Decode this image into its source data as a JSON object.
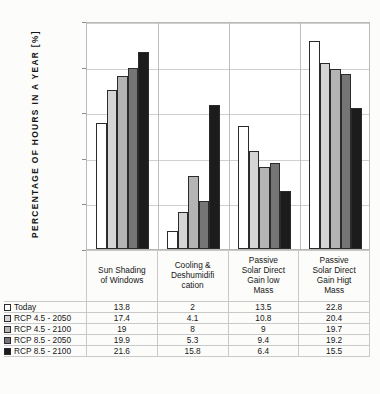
{
  "chart_data": {
    "type": "bar",
    "title": "",
    "xlabel": "",
    "ylabel": "PERCENTAGE OF HOURS IN A YEAR  [%]",
    "ylim": [
      0,
      25
    ],
    "yticks": [
      0,
      5,
      10,
      15,
      20,
      25
    ],
    "grid": true,
    "legend_position": "table-left-column",
    "categories": [
      "Sun Shading of Windows",
      "Cooling & Deshumidifi cation",
      "Passive Solar Direct Gain low Mass",
      "Passive Solar Direct Gain Higt Mass"
    ],
    "series": [
      {
        "name": "Today",
        "color": "#ffffff",
        "values": [
          13.8,
          2,
          13.5,
          22.8
        ]
      },
      {
        "name": "RCP 4.5 - 2050",
        "color": "#d5d5d5",
        "values": [
          17.4,
          4.1,
          10.8,
          20.4
        ]
      },
      {
        "name": "RCP 4.5 - 2100",
        "color": "#b4b4b4",
        "values": [
          19,
          8,
          9,
          19.7
        ]
      },
      {
        "name": "RCP 8.5 - 2050",
        "color": "#757575",
        "values": [
          19.9,
          5.3,
          9.4,
          19.2
        ]
      },
      {
        "name": "RCP 8.5 - 2100",
        "color": "#1c1c1c",
        "values": [
          21.6,
          15.8,
          6.4,
          15.5
        ]
      }
    ]
  },
  "axis": {
    "y_title": "PERCENTAGE OF HOURS IN A YEAR  [%]",
    "tick_labels": [
      "25",
      "20",
      "15",
      "10",
      "5",
      "0"
    ]
  },
  "table": {
    "column_headers": [
      {
        "lines": [
          "Sun Shading",
          "of Windows"
        ]
      },
      {
        "lines": [
          "Cooling &",
          "Deshumidifi",
          "cation"
        ]
      },
      {
        "lines": [
          "Passive",
          "Solar Direct",
          "Gain low",
          "Mass"
        ]
      },
      {
        "lines": [
          "Passive",
          "Solar Direct",
          "Gain Higt",
          "Mass"
        ]
      }
    ],
    "rows": [
      {
        "label": "Today",
        "swatch": "#ffffff",
        "values": [
          "13.8",
          "2",
          "13.5",
          "22.8"
        ]
      },
      {
        "label": "RCP 4.5 - 2050",
        "swatch": "#d5d5d5",
        "values": [
          "17.4",
          "4.1",
          "10.8",
          "20.4"
        ]
      },
      {
        "label": "RCP 4.5 - 2100",
        "swatch": "#b4b4b4",
        "values": [
          "19",
          "8",
          "9",
          "19.7"
        ]
      },
      {
        "label": "RCP 8.5 - 2050",
        "swatch": "#757575",
        "values": [
          "19.9",
          "5.3",
          "9.4",
          "19.2"
        ]
      },
      {
        "label": "RCP 8.5 - 2100",
        "swatch": "#1c1c1c",
        "values": [
          "21.6",
          "15.8",
          "6.4",
          "15.5"
        ]
      }
    ]
  }
}
